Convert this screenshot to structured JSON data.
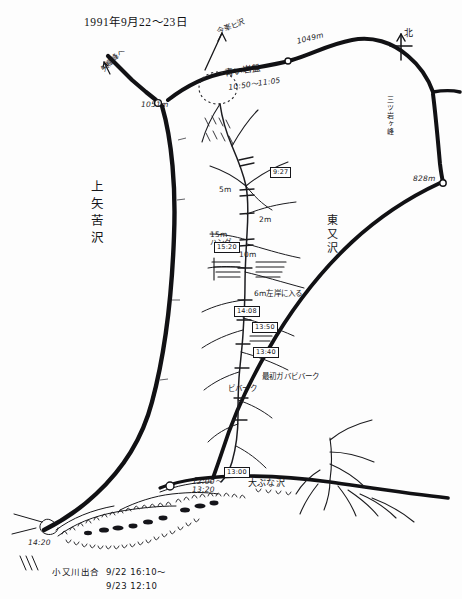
{
  "document": {
    "kind": "hand-drawn-sketch-map",
    "title": "1991年9月22～23日",
    "signature_line_1": "小又川出合  9/22 16:10～",
    "signature_line_2": "9/23 12:10"
  },
  "compass": {
    "label": "北"
  },
  "ridge_labels": {
    "to_yabitsu_peak": "矢櫃峰へ",
    "konzan_ridge": "今峯ヒ沢",
    "blue_bedrock": "←青い岩盤",
    "blue_bedrock_time": "10:50～11:05",
    "elev_1051": "1051m",
    "elev_1049": "1049m",
    "elev_828": "828m",
    "mitsuiwa_peak": "三ツ岩ヶ峰"
  },
  "valley_labels": {
    "left_valley": "上矢苦沢",
    "right_valley": "東又沢",
    "bottom_valley": "大ぶな沢"
  },
  "pitch_notes": [
    {
      "id": "p-5m",
      "text": "5m",
      "x": 219,
      "y": 186
    },
    {
      "id": "p-2m",
      "text": "2m",
      "x": 259,
      "y": 216
    },
    {
      "id": "p-15m-hang",
      "text": "15m\nハング",
      "x": 210,
      "y": 231
    },
    {
      "id": "p-10m",
      "text": "10m",
      "x": 239,
      "y": 251
    },
    {
      "id": "p-6m-left",
      "text": "6m左岸に入る",
      "x": 254,
      "y": 290
    },
    {
      "id": "p-biv",
      "text": "最初ガバビバーク",
      "x": 262,
      "y": 373
    },
    {
      "id": "p-biv-jp",
      "text": "ビバーク",
      "x": 228,
      "y": 385
    }
  ],
  "time_boxes": [
    {
      "id": "t-927",
      "text": "9:27",
      "x": 270,
      "y": 161
    },
    {
      "id": "t-1520",
      "text": "15:20",
      "x": 214,
      "y": 236
    },
    {
      "id": "t-1408",
      "text": "14:08",
      "x": 234,
      "y": 300
    },
    {
      "id": "t-1350",
      "text": "13:50",
      "x": 252,
      "y": 316
    },
    {
      "id": "t-1340",
      "text": "13:40",
      "x": 253,
      "y": 341
    },
    {
      "id": "t-1300",
      "text": "13:00",
      "x": 224,
      "y": 461
    }
  ],
  "times_plain": [
    {
      "id": "tp-noon",
      "text": "12:00～\n13:20",
      "x": 192,
      "y": 478
    },
    {
      "id": "tp-1420",
      "text": "14:20",
      "x": 28,
      "y": 539
    }
  ],
  "colors": {
    "ink": "#17171a",
    "paper": "#fdfdfd",
    "ridge_stroke": "#111114"
  }
}
